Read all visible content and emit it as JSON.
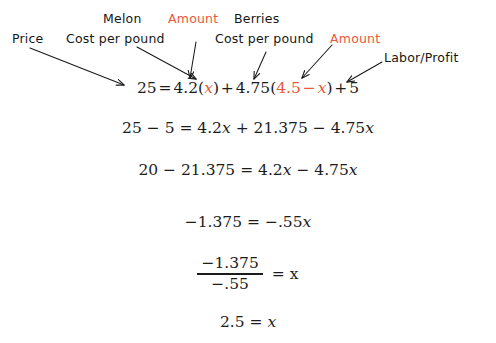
{
  "colors": {
    "background": "#ffffff",
    "text": "#1a1a1a",
    "accent_red": "#e8593c",
    "arrow": "#1a1a1a"
  },
  "annotations": {
    "price": "Price",
    "melon": "Melon",
    "melon_cost": "Cost per pound",
    "amount_melon": "Amount",
    "berries": "Berries",
    "berries_cost": "Cost per pound",
    "amount_berries": "Amount",
    "labor_profit": "Labor/Profit"
  },
  "equations": {
    "line1": {
      "lhs": "25",
      "eq": "=",
      "melon_rate": "4.2",
      "open1": "(",
      "x1": "x",
      "close1": ")",
      "plus1": "+",
      "berries_rate": "4.75",
      "open2": "(",
      "amount_expr": "4.5",
      "minus": "−",
      "x2": "x",
      "close2": ")",
      "plus2": "+",
      "labor": "5"
    },
    "line2": "25 − 5 = 4.2x + 21.375 − 4.75x",
    "line3": "20 − 21.375 = 4.2x − 4.75x",
    "line4": "−1.375 = −.55x",
    "line5": {
      "numerator": "−1.375",
      "denominator": "−.55",
      "rhs": "= x"
    },
    "line6": "2.5 = x"
  },
  "arrows": [
    {
      "name": "arrow-price",
      "from": [
        30,
        48
      ],
      "to": [
        124,
        85
      ]
    },
    {
      "name": "arrow-melon-cost",
      "from": [
        137,
        47
      ],
      "to": [
        196,
        79
      ]
    },
    {
      "name": "arrow-amount-melon",
      "from": [
        196,
        44
      ],
      "to": [
        190,
        78
      ]
    },
    {
      "name": "arrow-berries-cost",
      "from": [
        264,
        54
      ],
      "to": [
        253,
        79
      ]
    },
    {
      "name": "arrow-amount-berries",
      "from": [
        330,
        47
      ],
      "to": [
        302,
        78
      ]
    },
    {
      "name": "arrow-labor-profit",
      "from": [
        380,
        62
      ],
      "to": [
        347,
        84
      ]
    }
  ]
}
